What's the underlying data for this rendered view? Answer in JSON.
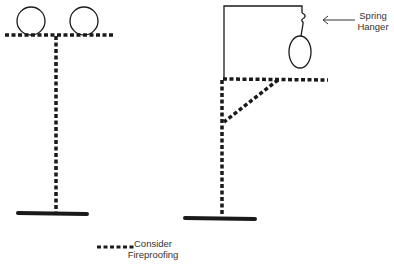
{
  "diagram": {
    "colors": {
      "line": "#1a1a1a",
      "background": "#ffffff"
    },
    "left_support": {
      "type": "T-support with two pipes",
      "pipes": [
        {
          "cx": 30,
          "cy": 21,
          "r": 14
        },
        {
          "cx": 84,
          "cy": 21,
          "r": 14
        }
      ]
    },
    "right_support": {
      "type": "Cantilever support with spring hanger",
      "hanger_label_line1": "Spring",
      "hanger_label_line2": "Hanger"
    },
    "legend": {
      "label_line1": "Consider",
      "label_line2": "Fireproofing",
      "symbol": "dashed-line"
    }
  }
}
